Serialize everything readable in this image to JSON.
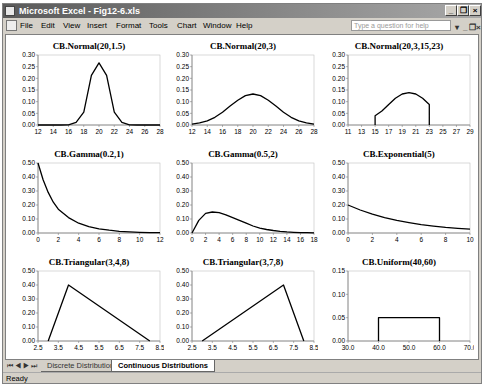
{
  "window": {
    "title": "Microsoft Excel - Fig12-6.xls",
    "controls": {
      "minimize": "_",
      "restore": "❐",
      "close": "×"
    }
  },
  "menubar": {
    "items": [
      {
        "label": "File",
        "x": 17
      },
      {
        "label": "Edit",
        "x": 38
      },
      {
        "label": "View",
        "x": 60
      },
      {
        "label": "Insert",
        "x": 84
      },
      {
        "label": "Format",
        "x": 113
      },
      {
        "label": "Tools",
        "x": 146
      },
      {
        "label": "Chart",
        "x": 174
      },
      {
        "label": "Window",
        "x": 200
      },
      {
        "label": "Help",
        "x": 233
      }
    ],
    "help_placeholder": "Type a question for help",
    "doc_controls": {
      "dropdown": "▾",
      "minimize": "_",
      "restore": "❐",
      "close": "×"
    }
  },
  "sheet_tabs": {
    "nav": "⏮◀▶⏭",
    "tabs": [
      {
        "label": "Discrete Distributions",
        "active": false
      },
      {
        "label": "Continuous Distributions",
        "active": true
      }
    ]
  },
  "status_bar": {
    "text": "Ready"
  },
  "colors": {
    "line": "#000000",
    "axis": "#808080",
    "plot_border": "#c0c0c0"
  },
  "chart_data": [
    {
      "type": "line",
      "title": "CB.Normal(20,1.5)",
      "xlim": [
        12,
        28
      ],
      "xticks": [
        12,
        14,
        16,
        18,
        20,
        22,
        24,
        26,
        28
      ],
      "ylim": [
        0,
        0.3
      ],
      "yticks": [
        0.0,
        0.05,
        0.1,
        0.15,
        0.2,
        0.25,
        0.3
      ],
      "ydec": 2,
      "x": [
        12,
        14,
        15,
        16,
        17,
        18,
        19,
        20,
        21,
        22,
        23,
        24,
        25,
        26,
        28
      ],
      "y": [
        0,
        0,
        0,
        0.001,
        0.011,
        0.055,
        0.213,
        0.266,
        0.213,
        0.055,
        0.011,
        0.001,
        0,
        0,
        0
      ]
    },
    {
      "type": "line",
      "title": "CB.Normal(20,3)",
      "xlim": [
        12,
        28
      ],
      "xticks": [
        12,
        14,
        16,
        18,
        20,
        22,
        24,
        26,
        28
      ],
      "ylim": [
        0,
        0.3
      ],
      "yticks": [
        0.0,
        0.05,
        0.1,
        0.15,
        0.2,
        0.25,
        0.3
      ],
      "ydec": 2,
      "x": [
        12,
        13,
        14,
        15,
        16,
        17,
        18,
        19,
        20,
        21,
        22,
        23,
        24,
        25,
        26,
        27,
        28
      ],
      "y": [
        0.004,
        0.009,
        0.018,
        0.033,
        0.055,
        0.081,
        0.106,
        0.126,
        0.133,
        0.126,
        0.106,
        0.081,
        0.055,
        0.033,
        0.018,
        0.009,
        0.004
      ]
    },
    {
      "type": "line",
      "title": "CB.Normal(20,3,15,23)",
      "xlim": [
        11,
        29
      ],
      "xticks": [
        11,
        13,
        15,
        17,
        19,
        21,
        23,
        25,
        27,
        29
      ],
      "ylim": [
        0,
        0.3
      ],
      "yticks": [
        0.0,
        0.05,
        0.1,
        0.15,
        0.2,
        0.25,
        0.3
      ],
      "ydec": 2,
      "x": [
        15,
        15,
        16,
        17,
        18,
        19,
        20,
        21,
        22,
        23,
        23
      ],
      "y": [
        0,
        0.04,
        0.06,
        0.088,
        0.115,
        0.133,
        0.139,
        0.133,
        0.115,
        0.088,
        0
      ]
    },
    {
      "type": "line",
      "title": "CB.Gamma(0.2,1)",
      "xlim": [
        0,
        12
      ],
      "xticks": [
        0,
        2,
        4,
        6,
        8,
        10,
        12
      ],
      "ylim": [
        0,
        0.5
      ],
      "yticks": [
        0.0,
        0.1,
        0.2,
        0.3,
        0.4,
        0.5
      ],
      "ydec": 2,
      "x": [
        0,
        0.5,
        1,
        1.5,
        2,
        3,
        4,
        5,
        6,
        7,
        8,
        9,
        10,
        11,
        12
      ],
      "y": [
        0.5,
        0.38,
        0.29,
        0.22,
        0.17,
        0.11,
        0.07,
        0.045,
        0.03,
        0.02,
        0.012,
        0.008,
        0.005,
        0.003,
        0.002
      ]
    },
    {
      "type": "line",
      "title": "CB.Gamma(0.5,2)",
      "xlim": [
        0,
        18
      ],
      "xticks": [
        0,
        2,
        4,
        6,
        8,
        10,
        12,
        14,
        16,
        18
      ],
      "ylim": [
        0,
        0.5
      ],
      "yticks": [
        0.0,
        0.1,
        0.2,
        0.3,
        0.4,
        0.5
      ],
      "ydec": 2,
      "x": [
        0,
        1,
        2,
        3,
        4,
        5,
        6,
        7,
        8,
        9,
        10,
        11,
        12,
        13,
        14,
        15,
        16,
        17,
        18
      ],
      "y": [
        0,
        0.09,
        0.14,
        0.15,
        0.145,
        0.13,
        0.11,
        0.09,
        0.07,
        0.05,
        0.035,
        0.025,
        0.018,
        0.012,
        0.008,
        0.005,
        0.003,
        0.002,
        0.001
      ]
    },
    {
      "type": "line",
      "title": "CB.Exponential(5)",
      "xlim": [
        0,
        10
      ],
      "xticks": [
        0,
        2,
        4,
        6,
        8,
        10
      ],
      "ylim": [
        0,
        0.5
      ],
      "yticks": [
        0.0,
        0.1,
        0.2,
        0.3,
        0.4,
        0.5
      ],
      "ydec": 2,
      "x": [
        0,
        1,
        2,
        3,
        4,
        5,
        6,
        7,
        8,
        9,
        10
      ],
      "y": [
        0.2,
        0.164,
        0.134,
        0.11,
        0.09,
        0.074,
        0.06,
        0.049,
        0.04,
        0.033,
        0.027
      ]
    },
    {
      "type": "line",
      "title": "CB.Triangular(3,4,8)",
      "xlim": [
        2.5,
        8.5
      ],
      "xticks": [
        2.5,
        3.5,
        4.5,
        5.5,
        6.5,
        7.5,
        8.5
      ],
      "ylim": [
        0,
        0.5
      ],
      "yticks": [
        0.0,
        0.1,
        0.2,
        0.3,
        0.4,
        0.5
      ],
      "ydec": 2,
      "xdec": 1,
      "x": [
        3,
        4,
        8
      ],
      "y": [
        0,
        0.4,
        0
      ]
    },
    {
      "type": "line",
      "title": "CB.Triangular(3,7,8)",
      "xlim": [
        2.5,
        8.5
      ],
      "xticks": [
        2.5,
        3.5,
        4.5,
        5.5,
        6.5,
        7.5,
        8.5
      ],
      "ylim": [
        0,
        0.5
      ],
      "yticks": [
        0.0,
        0.1,
        0.2,
        0.3,
        0.4,
        0.5
      ],
      "ydec": 2,
      "xdec": 1,
      "x": [
        3,
        7,
        8
      ],
      "y": [
        0,
        0.4,
        0
      ]
    },
    {
      "type": "line",
      "title": "CB.Uniform(40,60)",
      "xlim": [
        30,
        70
      ],
      "xticks": [
        30.0,
        40.0,
        50.0,
        60.0,
        70.0
      ],
      "ylim": [
        0,
        0.15
      ],
      "yticks": [
        0.0,
        0.05,
        0.1,
        0.15
      ],
      "ydec": 2,
      "xdec": 1,
      "x": [
        40,
        40,
        60,
        60
      ],
      "y": [
        0,
        0.05,
        0.05,
        0
      ]
    }
  ],
  "chart_layout": [
    {
      "left": 8,
      "top": 6
    },
    {
      "left": 162,
      "top": 6
    },
    {
      "left": 318,
      "top": 6
    },
    {
      "left": 8,
      "top": 114
    },
    {
      "left": 162,
      "top": 114
    },
    {
      "left": 318,
      "top": 114
    },
    {
      "left": 8,
      "top": 222
    },
    {
      "left": 162,
      "top": 222
    },
    {
      "left": 318,
      "top": 222
    }
  ]
}
